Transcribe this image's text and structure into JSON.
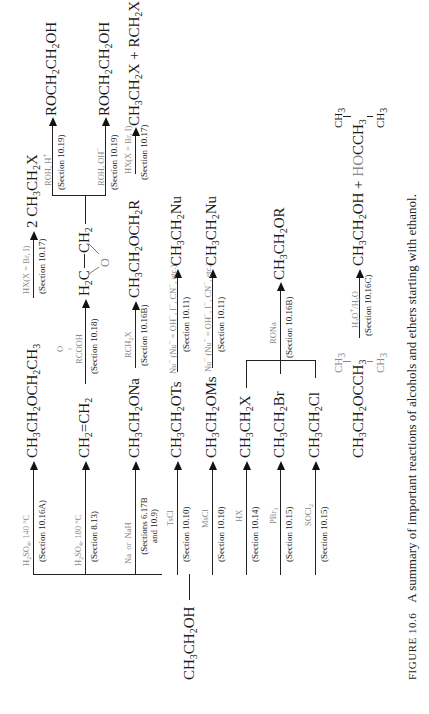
{
  "figure": {
    "number_label": "FIGURE 10.6",
    "caption": "A summary of important reactions of alcohols and ethers starting with ethanol."
  },
  "start": {
    "formula_html": "CH<sub>3</sub>CH<sub>2</sub>OH"
  },
  "branches": [
    {
      "reagent_html": "H<sub>2</sub>SO<sub>4</sub>, 140 °C",
      "section": "(Section 10.16A)",
      "product_html": "CH<sub>3</sub>CH<sub>2</sub>OCH<sub>2</sub>CH<sub>3</sub>",
      "next": {
        "reagent_html": "HX(X = Br, I)",
        "section": "(Section 10.17)",
        "product_html": "2 CH<sub>3</sub>CH<sub>2</sub>X"
      }
    },
    {
      "reagent_html": "H<sub>2</sub>SO<sub>4</sub>, 180 °C",
      "section": "(Section 8.13)",
      "product_html": "CH<sub>2</sub>=CH<sub>2</sub>",
      "next": {
        "reagent_html": "RCOOH (peroxy acid, O above)",
        "reagent_top": "O",
        "reagent_main": "RCOOH",
        "section": "(Section 10.18)",
        "product_html": "H<sub>2</sub>C—CH<sub>2</sub> (epoxide, O bridge)",
        "epoxide": {
          "left": "H<sub>2</sub>C",
          "bond": "—",
          "right": "CH<sub>2</sub>",
          "bridge": "O"
        },
        "split": [
          {
            "reagent_html": "ROH, H<sup>+</sup>",
            "section": "(Section 10.19)",
            "product_html": "ROCH<sub>2</sub>CH<sub>2</sub>OH"
          },
          {
            "reagent_html": "ROH, OH<sup>−</sup>",
            "section": "(Section 10.19)",
            "product_html": "ROCH<sub>2</sub>CH<sub>2</sub>OH"
          }
        ]
      }
    },
    {
      "reagent_html": "Na &nbsp;or&nbsp; NaH",
      "section": "(Sections 6.17B<br>and 10.9)",
      "product_html": "CH<sub>3</sub>CH<sub>2</sub>ONa",
      "next": {
        "reagent_html": "RCH<sub>2</sub>X",
        "section": "(Section 10.16B)",
        "product_html": "CH<sub>3</sub>CH<sub>2</sub>OCH<sub>2</sub>R",
        "next": {
          "reagent_html": "HX(X = Br, I)",
          "section": "(Section 10.17)",
          "product_html": "CH<sub>3</sub>CH<sub>2</sub>X + RCH<sub>2</sub>X"
        }
      }
    },
    {
      "reagent_html": "TsCl",
      "section": "(Section 10.10)",
      "product_html": "CH<sub>3</sub>CH<sub>2</sub>OTs",
      "next": {
        "reagent_html": "Nu<sup>−</sup> (Nu<sup>−</sup> = OH<sup>−</sup>, I<sup>−</sup>, CN<sup>−</sup>, etc.)",
        "section": "(Section 10.11)",
        "product_html": "CH<sub>3</sub>CH<sub>2</sub>Nu"
      }
    },
    {
      "reagent_html": "MsCl",
      "section": "(Section 10.10)",
      "product_html": "CH<sub>3</sub>CH<sub>2</sub>OMs",
      "next": {
        "reagent_html": "Nu<sup>−</sup> (Nu<sup>−</sup> = OH<sup>−</sup>, I<sup>−</sup>, CN<sup>−</sup>, etc.)",
        "section": "(Section 10.11)",
        "product_html": "CH<sub>3</sub>CH<sub>2</sub>Nu"
      }
    },
    {
      "reagent_html": "HX",
      "section": "(Section 10.14)",
      "product_html": "CH<sub>3</sub>CH<sub>2</sub>X"
    },
    {
      "reagent_html": "PBr<sub>3</sub>",
      "section": "(Section 10.15)",
      "product_html": "CH<sub>3</sub>CH<sub>2</sub>Br"
    },
    {
      "reagent_html": "SOCl<sub>2</sub>",
      "section": "(Section 10.15)",
      "product_html": "CH<sub>3</sub>CH<sub>2</sub>Cl"
    },
    {
      "reagent_html": "CH<sub>2</sub>=C(CH<sub>3</sub>)<sub>2</sub>/H<sub>2</sub>SO<sub>4</sub>",
      "section": "(Section 10.16C)",
      "product_html": "CH<sub>3</sub>CH<sub>2</sub>OC(CH<sub>3</sub>)<sub>3</sub>",
      "product_parts": {
        "main": "CH<sub>3</sub>CH<sub>2</sub>O",
        "center": "C",
        "right": "CH<sub>3</sub>",
        "top": "CH<sub>3</sub>",
        "bottom": "CH<sub>3</sub>"
      },
      "next": {
        "reagent_html": "H<sub>3</sub>O<sup>+</sup>/H<sub>2</sub>O",
        "section": "(Section 10.16C)",
        "product_html": "CH<sub>3</sub>CH<sub>2</sub>OH + HOC(CH<sub>3</sub>)<sub>3</sub>",
        "product_parts": {
          "main": "CH<sub>3</sub>CH<sub>2</sub>OH + ",
          "gray": "HO",
          "center": "C",
          "right": "CH<sub>3</sub>",
          "top": "CH<sub>3</sub>",
          "bottom": "CH<sub>3</sub>"
        }
      }
    }
  ],
  "merge": {
    "reagent_html": "RONa",
    "section": "(Section 10.16B)",
    "product_html": "CH<sub>3</sub>CH<sub>2</sub>OR"
  }
}
